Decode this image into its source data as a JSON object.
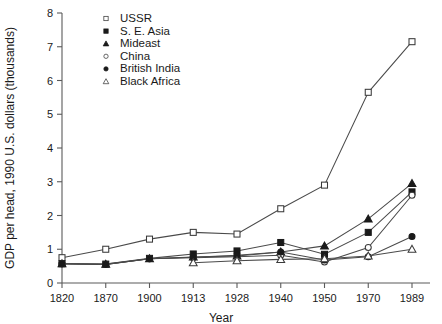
{
  "chart_data": {
    "type": "line",
    "title": "",
    "xlabel": "Year",
    "ylabel": "GDP per head, 1990 U.S. dollars (thousands)",
    "categories": [
      "1820",
      "1870",
      "1900",
      "1913",
      "1928",
      "1940",
      "1950",
      "1970",
      "1989"
    ],
    "xtick_labels": [
      "1820",
      "1870",
      "1900",
      "1913",
      "1928",
      "1940",
      "1950",
      "1970",
      "1989"
    ],
    "ytick_labels": [
      "0",
      "1",
      "2",
      "3",
      "4",
      "5",
      "6",
      "7",
      "8"
    ],
    "ylim": [
      0,
      8
    ],
    "ystep": 1,
    "grid": false,
    "legend_position": "top-left-inside",
    "series": [
      {
        "name": "USSR",
        "marker": "open-square",
        "values": [
          0.75,
          1.0,
          1.3,
          1.5,
          1.45,
          2.2,
          2.9,
          5.65,
          7.15
        ]
      },
      {
        "name": "S. E. Asia",
        "marker": "filled-square",
        "values": [
          0.57,
          0.56,
          0.73,
          0.86,
          0.95,
          1.2,
          0.85,
          1.5,
          2.7
        ]
      },
      {
        "name": "Mideast",
        "marker": "filled-triangle",
        "values": [
          0.57,
          0.56,
          0.72,
          0.77,
          0.8,
          0.92,
          1.1,
          1.9,
          2.95
        ]
      },
      {
        "name": "China",
        "marker": "open-circle",
        "values": [
          0.57,
          0.55,
          0.72,
          0.75,
          0.78,
          0.82,
          0.62,
          1.05,
          2.6
        ]
      },
      {
        "name": "British India",
        "marker": "filled-circle",
        "values": [
          0.57,
          0.55,
          0.72,
          0.76,
          0.82,
          0.92,
          0.68,
          0.78,
          1.38
        ]
      },
      {
        "name": "Black Africa",
        "marker": "open-triangle",
        "values": [
          null,
          null,
          null,
          0.6,
          0.66,
          0.7,
          0.72,
          0.8,
          1.0
        ]
      }
    ]
  },
  "legend": {
    "entries": [
      {
        "label": "USSR"
      },
      {
        "label": "S. E. Asia"
      },
      {
        "label": "Mideast"
      },
      {
        "label": "China"
      },
      {
        "label": "British India"
      },
      {
        "label": "Black Africa"
      }
    ]
  }
}
